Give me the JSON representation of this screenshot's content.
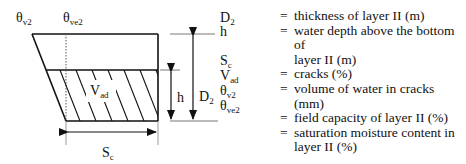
{
  "diagram": {
    "top_labels": {
      "theta_v2": {
        "base": "θ",
        "sub": "v2"
      },
      "theta_ve2": {
        "base": "θ",
        "sub": "ve2"
      }
    },
    "region_label": {
      "base": "V",
      "sub": "ad"
    },
    "dimension_labels": {
      "D2": {
        "base": "D",
        "sub": "2"
      },
      "h": "h",
      "Sc": {
        "base": "S",
        "sub": "c"
      }
    },
    "symbols": [
      {
        "base": "D",
        "sub": "2"
      },
      {
        "base": "h",
        "sub": ""
      },
      {
        "base": "S",
        "sub": "c"
      },
      {
        "base": "V",
        "sub": "ad"
      },
      {
        "base": "θ",
        "sub": "v2"
      },
      {
        "base": "θ",
        "sub": "ve2"
      }
    ]
  },
  "legend": [
    {
      "eq": "=",
      "text": "thickness of layer II (m)"
    },
    {
      "eq": "=",
      "text": "water depth above the bottom of"
    },
    {
      "eq": "",
      "text": "layer II (m)"
    },
    {
      "eq": "=",
      "text": "cracks (%)"
    },
    {
      "eq": "=",
      "text": "volume of water in cracks (mm)"
    },
    {
      "eq": "=",
      "text": "field capacity of layer II (%)"
    },
    {
      "eq": "=",
      "text": "saturation moisture content in"
    },
    {
      "eq": "",
      "text": "layer II (%)"
    }
  ]
}
